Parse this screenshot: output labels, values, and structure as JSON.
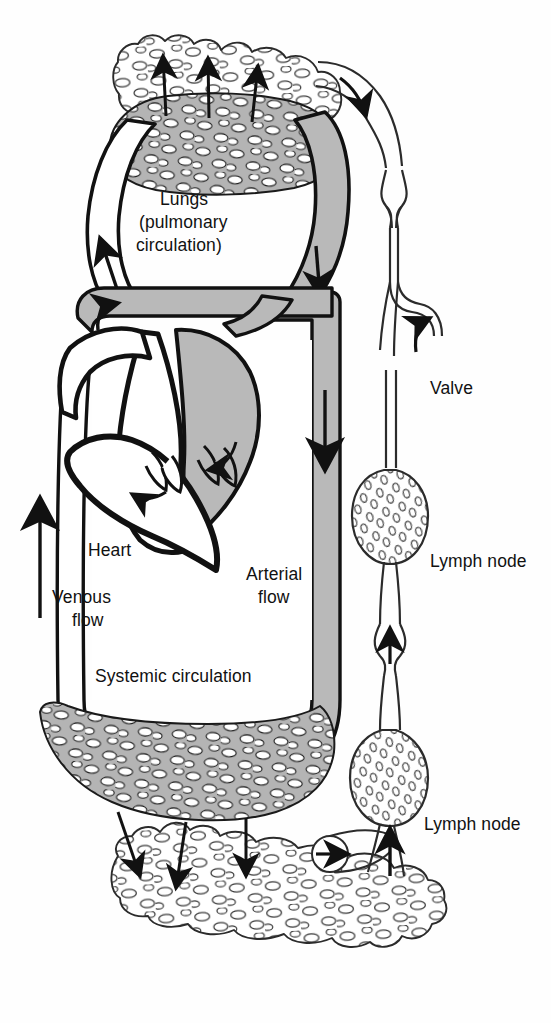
{
  "figure": {
    "background_color": "#fefefe",
    "ink_color": "#111111",
    "arterial_fill": "#b9b9b9",
    "venous_fill": "#ffffff",
    "capillary_fill": "#b4b4b4",
    "lymph_fill": "#ffffff"
  },
  "labels": {
    "lungs_line1": "Lungs",
    "lungs_line2": "(pulmonary",
    "lungs_line3": "circulation)",
    "heart": "Heart",
    "venous_line1": "Venous",
    "venous_line2": "flow",
    "arterial_line1": "Arterial",
    "arterial_line2": "flow",
    "systemic": "Systemic circulation",
    "valve": "Valve",
    "lymph_node_upper": "Lymph node",
    "lymph_node_lower": "Lymph node"
  },
  "structures": {
    "pulmonary_capillary_bed": "lung-capillary-bed",
    "systemic_capillary_bed": "systemic-capillary-bed",
    "lung_lymph_tissue": "lung-lymphatic-tissue",
    "peripheral_lymph_tissue": "peripheral-lymphatic-tissue",
    "lymphatic_capillary": "blind-ended-lymphatic-capillary",
    "thoracic_duct": "lymphatic-duct",
    "heart_left_side": "left-heart-arterial",
    "heart_right_side": "right-heart-venous"
  },
  "flow_arrows": {
    "venous_up": "arrow-up-venous-return",
    "arterial_down": "arrow-down-arterial-outflow",
    "pulmonary_up": "arrow-up-pulmonary-artery",
    "pulmonary_down": "arrow-down-pulmonary-vein",
    "lymph_up_1": "arrow-up-lymph-duct-upper",
    "lymph_up_2": "arrow-up-lymph-duct-valve",
    "lymph_up_3": "arrow-up-lymph-node-inlet",
    "lymph_right": "arrow-right-lymph-capillary-uptake",
    "tissue_drain_lung": "arrows-lung-interstitium-drainage",
    "tissue_drain_systemic": "arrows-tissue-interstitium-drainage"
  }
}
